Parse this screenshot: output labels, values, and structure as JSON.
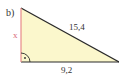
{
  "figure": {
    "part_label": "b)",
    "hypotenuse_label": "15,4",
    "base_label": "9,2",
    "unknown_side_label": "x",
    "right_angle_marker": "·",
    "colors": {
      "fill": "#fbf7cc",
      "edge": "#2a2a2a",
      "unknown_side": "#e88a8a",
      "unknown_label": "#d96a7a",
      "text": "#333333"
    }
  }
}
